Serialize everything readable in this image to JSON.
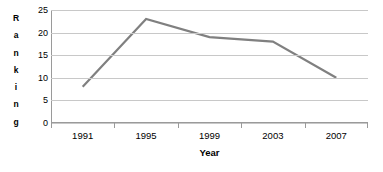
{
  "chart_data": {
    "type": "line",
    "title": "",
    "subtitle": "",
    "xlabel": "Year",
    "ylabel": "Ranking",
    "categories": [
      "1991",
      "1995",
      "1999",
      "2003",
      "2007"
    ],
    "values": [
      8,
      23,
      19,
      18,
      10
    ],
    "series": [
      {
        "name": "Ranking",
        "values": [
          8,
          23,
          19,
          18,
          10
        ]
      }
    ],
    "ylim": [
      0,
      25
    ],
    "y_ticks": [
      0,
      5,
      10,
      15,
      20,
      25
    ],
    "y_tick_labels": [
      "0",
      "5",
      "10",
      "15",
      "20",
      "25"
    ],
    "x_tick_labels": [
      "1991",
      "1995",
      "1999",
      "2003",
      "2007"
    ],
    "grid": true,
    "grid_axis": "y",
    "legend": false,
    "legend_position": "none",
    "markers": false,
    "annotations": [],
    "colors": {
      "series_line": "#808080",
      "gridline": "#c8c8c8",
      "axis_line": "#9a9a9a",
      "background": "#ffffff",
      "text": "#000000"
    }
  },
  "axis": {
    "y_title_letters": [
      "R",
      "a",
      "n",
      "k",
      "i",
      "n",
      "g"
    ],
    "x_title": "Year"
  }
}
